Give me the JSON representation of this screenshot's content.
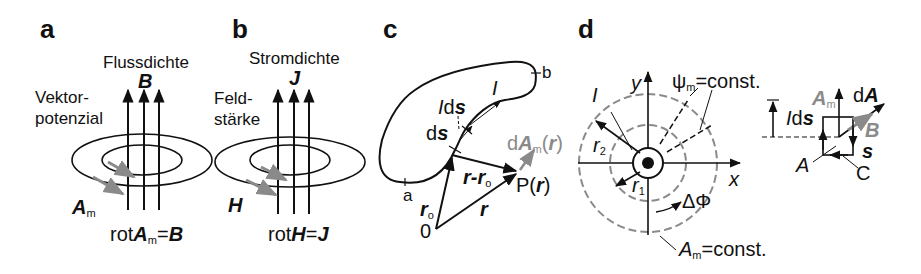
{
  "panels": {
    "a": {
      "label": "a",
      "title": "Flussdichte",
      "field_symbol": "B",
      "side_label_line1": "Vektor-",
      "side_label_line2": "potenzial",
      "loop_symbol": "A",
      "loop_sub": "m",
      "equation_prefix": "rot",
      "equation_A": "A",
      "equation_sub": "m",
      "equation_eq": "=",
      "equation_rhs": "B"
    },
    "b": {
      "label": "b",
      "title": "Stromdichte",
      "field_symbol": "J",
      "side_label_line1": "Feld-",
      "side_label_line2": "stärke",
      "loop_symbol": "H",
      "equation_prefix": "rot",
      "equation_H": "H",
      "equation_eq": "=",
      "equation_rhs": "J"
    },
    "c": {
      "label": "c",
      "point_a": "a",
      "point_b": "b",
      "current": "I",
      "Ids_I": "I",
      "Ids_d": "d",
      "Ids_s": "s",
      "ds_d": "d",
      "ds_s": "s",
      "r0": "r",
      "r0_sub": "o",
      "r_minus_r0_r": "r",
      "r_minus_r0_dash": "-",
      "r_minus_r0_r0": "r",
      "r_minus_r0_sub": "o",
      "r": "r",
      "origin": "0",
      "point_P": "P(",
      "point_P_r": "r",
      "point_P_close": ")",
      "dA_d": "d",
      "dA_A": "A",
      "dA_sub": "m",
      "dA_open": "(",
      "dA_r": "r",
      "dA_close": ")"
    },
    "d": {
      "label": "d",
      "axis_y": "y",
      "axis_x": "x",
      "current": "I",
      "r2": "r",
      "r2_sub": "2",
      "r1": "r",
      "r1_sub": "1",
      "psi": "ψ",
      "psi_sub": "m",
      "psi_const": "=const.",
      "delta_phi": "ΔΦ",
      "Am_A": "A",
      "Am_sub": "m",
      "Am_const": "=const.",
      "inset": {
        "Ids_I": "I",
        "Ids_d": "d",
        "Ids_s": "s",
        "Am_A": "A",
        "Am_sub": "m",
        "dA_d": "d",
        "dA_A": "A",
        "B": "B",
        "s": "s",
        "A": "A",
        "C": "C"
      }
    }
  },
  "colors": {
    "ink": "#111111",
    "gray": "#8a8a8a"
  }
}
